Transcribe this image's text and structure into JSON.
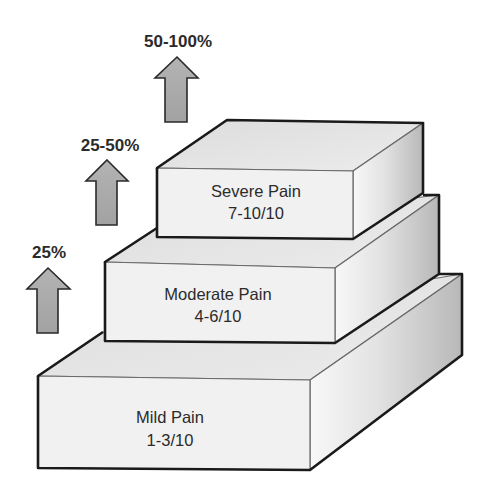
{
  "diagram": {
    "type": "stepped-pyramid",
    "colors": {
      "background": "#ffffff",
      "outline": "#1a1a1a",
      "top_face": "#e4e4e4",
      "front_face": "#f1f1f1",
      "side_light": "#f7f7f7",
      "side_dark": "#b9b9b9",
      "arrow_fill": "#a9a9a9",
      "text": "#2b2b2b"
    },
    "blocks": [
      {
        "id": "mild",
        "title": "Mild Pain",
        "range": "1-3/10"
      },
      {
        "id": "moderate",
        "title": "Moderate Pain",
        "range": "4-6/10"
      },
      {
        "id": "severe",
        "title": "Severe Pain",
        "range": "7-10/10"
      }
    ],
    "arrows": [
      {
        "id": "arrow-mild-to-moderate",
        "label": "25%"
      },
      {
        "id": "arrow-moderate-to-severe",
        "label": "25-50%"
      },
      {
        "id": "arrow-severe-top",
        "label": "50-100%"
      }
    ]
  }
}
